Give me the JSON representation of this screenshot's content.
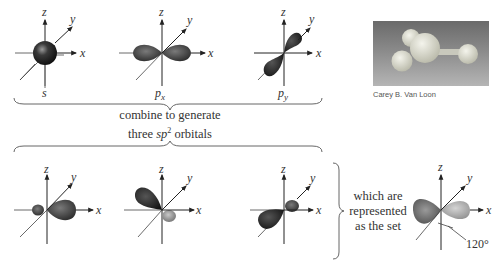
{
  "figure": {
    "top_row": {
      "orbitals": [
        {
          "label": "s",
          "axes": {
            "x": "x",
            "y": "y",
            "z": "z"
          }
        },
        {
          "label": "p",
          "subscript": "x",
          "axes": {
            "x": "x",
            "y": "y",
            "z": "z"
          }
        },
        {
          "label": "p",
          "subscript": "y",
          "axes": {
            "x": "x",
            "y": "y",
            "z": "z"
          }
        }
      ]
    },
    "combine_caption": {
      "line1": "combine to generate",
      "line2_prefix": "three ",
      "line2_sp": "sp",
      "line2_sup": "2",
      "line2_suffix": " orbitals"
    },
    "bottom_row": {
      "hybrid_orbitals": [
        {
          "axes": {
            "x": "x",
            "y": "y",
            "z": "z"
          }
        },
        {
          "axes": {
            "x": "x",
            "y": "y",
            "z": "z"
          }
        },
        {
          "axes": {
            "x": "x",
            "y": "y",
            "z": "z"
          }
        }
      ],
      "set_caption": [
        "which are",
        "represented",
        "as the set"
      ],
      "set_axes": {
        "x": "x",
        "y": "y",
        "z": "z"
      },
      "angle_label": "120°"
    },
    "photo": {
      "credit": "Carey B. Van Loon"
    }
  }
}
